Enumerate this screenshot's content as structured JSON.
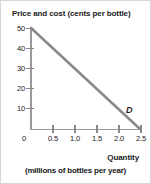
{
  "chart_data": {
    "type": "line",
    "title": "",
    "ylabel": "Price and cost (cents per bottle)",
    "xlabel": "Quantity",
    "xlabel_sub": "(millions of bottles per year)",
    "xlim": [
      0,
      2.75
    ],
    "ylim": [
      0,
      52
    ],
    "grid": false,
    "legend": "none",
    "y_ticks": [
      {
        "label": "50",
        "value": 50
      },
      {
        "label": "40",
        "value": 40
      },
      {
        "label": "30",
        "value": 30
      },
      {
        "label": "20",
        "value": 20
      },
      {
        "label": "10",
        "value": 10
      }
    ],
    "x_ticks": [
      {
        "label": "0",
        "value": 0
      },
      {
        "label": "0.5",
        "value": 0.5
      },
      {
        "label": "1.0",
        "value": 1.0
      },
      {
        "label": "1.5",
        "value": 1.5
      },
      {
        "label": "2.0",
        "value": 2.0
      },
      {
        "label": "2.5",
        "value": 2.5
      }
    ],
    "series": [
      {
        "name": "D",
        "annotation": "D",
        "color": "#8a8a8a",
        "x": [
          0,
          2.5
        ],
        "values": [
          50,
          0
        ]
      }
    ]
  },
  "annotations": {
    "curve_label": "D"
  },
  "colors": {
    "line": "#8a8a8a",
    "axis": "#999999",
    "text": "#1a1a1a",
    "frame": "#d8d8d8"
  }
}
